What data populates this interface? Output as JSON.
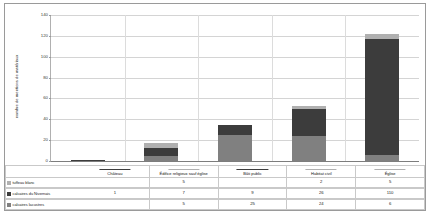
{
  "axis": {
    "y_title": "nombre de mentions de matériaux",
    "y_ticks": [
      "140",
      "120",
      "100",
      "80",
      "60",
      "40",
      "20",
      "0"
    ]
  },
  "colors": {
    "tuffeau_blanc": "#b0b0b0",
    "calcaires_nivernais": "#3c3c3c",
    "calcaires_lacustres": "#808080",
    "gridline": "#d4d4d4",
    "border": "#9a9a9a"
  },
  "legend": [
    {
      "label": "tuffeau blanc",
      "color": "#b0b0b0"
    },
    {
      "label": "calcaires du Nivernais",
      "color": "#3c3c3c"
    },
    {
      "label": "calcaires lacustres",
      "color": "#808080"
    }
  ],
  "table": {
    "categories": [
      "Château",
      "Édifice religieux sauf église",
      "Bâti public",
      "Habitat civil",
      "Église"
    ],
    "rows": [
      {
        "label": "tuffeau blanc",
        "values": [
          "",
          "5",
          "",
          "2",
          "5"
        ]
      },
      {
        "label": "calcaires du Nivernais",
        "values": [
          "1",
          "7",
          "9",
          "26",
          "110"
        ]
      },
      {
        "label": "calcaires lacustres",
        "values": [
          "",
          "5",
          "25",
          "24",
          "6"
        ]
      }
    ]
  },
  "chart_data": {
    "type": "bar",
    "stacked": true,
    "title": "",
    "xlabel": "",
    "ylabel": "nombre de mentions de matériaux",
    "ylim": [
      0,
      140
    ],
    "ytick_step": 20,
    "grid": true,
    "legend_position": "table-below",
    "categories": [
      "Château",
      "Édifice religieux sauf église",
      "Bâti public",
      "Habitat civil",
      "Église"
    ],
    "series": [
      {
        "name": "calcaires lacustres",
        "color": "#808080",
        "values": [
          0,
          5,
          25,
          24,
          6
        ]
      },
      {
        "name": "calcaires du Nivernais",
        "color": "#3c3c3c",
        "values": [
          1,
          7,
          9,
          26,
          110
        ]
      },
      {
        "name": "tuffeau blanc",
        "color": "#b0b0b0",
        "values": [
          0,
          5,
          0,
          2,
          5
        ]
      }
    ],
    "totals": [
      1,
      17,
      34,
      52,
      121
    ]
  }
}
